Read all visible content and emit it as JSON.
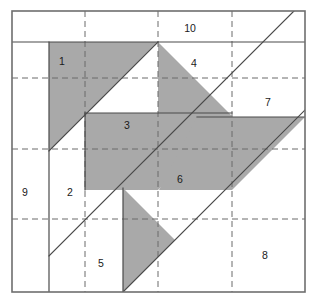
{
  "figure": {
    "canvas": {
      "width": 313,
      "height": 305
    },
    "colors": {
      "shaded_fill": "#a9a9a9",
      "plain_fill": "#ffffff",
      "solid_edge": "#4a4a4a",
      "dashed_grid": "#6b6b6b",
      "outer_frame": "#6e6e6e",
      "label_text": "#1a1a1a",
      "background": "#ffffff"
    },
    "frame": {
      "x": 12,
      "y": 11,
      "width": 293,
      "height": 281
    },
    "grid": {
      "dashed_vertical_x": [
        85,
        158,
        232
      ],
      "dashed_horizontal_y": [
        78,
        149,
        219
      ],
      "style": "dashed"
    },
    "labels": [
      {
        "id": "1",
        "text": "1",
        "x": 62,
        "y": 62,
        "shaded": true
      },
      {
        "id": "2",
        "text": "2",
        "x": 70,
        "y": 193,
        "shaded": false
      },
      {
        "id": "3",
        "text": "3",
        "x": 127,
        "y": 126,
        "shaded": true
      },
      {
        "id": "4",
        "text": "4",
        "x": 194,
        "y": 64,
        "shaded": false
      },
      {
        "id": "5",
        "text": "5",
        "x": 101,
        "y": 264,
        "shaded": false
      },
      {
        "id": "6",
        "text": "6",
        "x": 180,
        "y": 180,
        "shaded": true
      },
      {
        "id": "7",
        "text": "7",
        "x": 268,
        "y": 103,
        "shaded": false
      },
      {
        "id": "8",
        "text": "8",
        "x": 265,
        "y": 256,
        "shaded": false
      },
      {
        "id": "9",
        "text": "9",
        "x": 25,
        "y": 193,
        "shaded": false
      },
      {
        "id": "10",
        "text": "10",
        "x": 190,
        "y": 29,
        "shaded": false
      }
    ],
    "pieces": [
      {
        "id": "piece-1",
        "label": "1",
        "shaded": true,
        "points": "49,42 158,42 49,151",
        "shape": "right triangle"
      },
      {
        "id": "piece-3",
        "label": "3",
        "shaded": true,
        "points": "85,113 158,113 158,42 232,116 158,190 85,190",
        "shape": "hexagon"
      },
      {
        "id": "piece-5-notch",
        "label": "5",
        "shaded": true,
        "points": "123,188 123,292 175,240",
        "shape": "triangle"
      },
      {
        "id": "piece-6",
        "label": "6",
        "shaded": true,
        "points": "197,117 305,117 232,190 159,190",
        "shape": "quadrilateral"
      },
      {
        "id": "piece-10",
        "label": "10",
        "shaded": false,
        "points": "12,11 305,11 305,42 12,42",
        "shape": "rectangle strip"
      },
      {
        "id": "piece-4",
        "label": "4",
        "shaded": false,
        "points": "158,42 232,42 232,116",
        "shape": "triangle"
      },
      {
        "id": "piece-7",
        "label": "7",
        "shaded": false,
        "points": "232,116 305,42 305,117",
        "shape": "triangle"
      },
      {
        "id": "piece-9",
        "label": "9",
        "shaded": false,
        "points": "12,42 49,42 49,292 12,292",
        "shape": "vertical strip"
      },
      {
        "id": "piece-2",
        "label": "2",
        "shaded": false,
        "points": "49,151 85,113 85,190 49,256",
        "shape": "quadrilateral"
      },
      {
        "id": "piece-8",
        "label": "8",
        "shaded": false,
        "points": "232,190 305,117 305,292 175,292",
        "shape": "quadrilateral"
      }
    ],
    "solid_edges": [
      {
        "id": "edge-top-strip",
        "x1": 12,
        "y1": 42,
        "x2": 305,
        "y2": 42
      },
      {
        "id": "edge-left-strip",
        "x1": 49,
        "y1": 42,
        "x2": 49,
        "y2": 292
      },
      {
        "id": "edge-diag-main",
        "x1": 49,
        "y1": 256,
        "x2": 305,
        "y2": 0
      },
      {
        "id": "edge-diag-upper",
        "x1": 49,
        "y1": 151,
        "x2": 158,
        "y2": 42
      },
      {
        "id": "edge-piece2-right",
        "x1": 85,
        "y1": 113,
        "x2": 85,
        "y2": 190
      },
      {
        "id": "edge-piece3-top",
        "x1": 85,
        "y1": 113,
        "x2": 232,
        "y2": 113
      },
      {
        "id": "edge-piece5-left",
        "x1": 123,
        "y1": 188,
        "x2": 123,
        "y2": 292
      },
      {
        "id": "edge-piece6-top",
        "x1": 197,
        "y1": 117,
        "x2": 305,
        "y2": 117
      },
      {
        "id": "edge-diag-lower",
        "x1": 123,
        "y1": 292,
        "x2": 305,
        "y2": 110
      }
    ]
  }
}
